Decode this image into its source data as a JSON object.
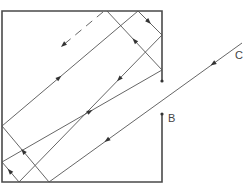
{
  "diagram": {
    "title": "",
    "labels": {
      "point_b": "B",
      "point_c": "C"
    },
    "colors": {
      "wall": "#4a4a4a",
      "ray": "#555555",
      "background": "#ffffff"
    },
    "path_order": [
      "incoming ray from C",
      "reflect at bottom wall",
      "reflect at left wall",
      "reflect at top wall",
      "reflect at right wall",
      "reflect at bottom wall",
      "reflect at left wall",
      "reflect at right wall",
      "reflect at top wall",
      "exit (dashed)"
    ]
  }
}
